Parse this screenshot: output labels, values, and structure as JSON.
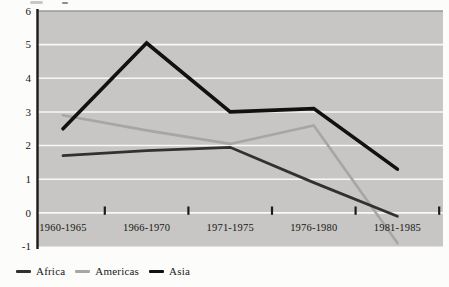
{
  "chart_data": {
    "type": "line",
    "title": "",
    "categories": [
      "1960-1965",
      "1966-1970",
      "1971-1975",
      "1976-1980",
      "1981-1985"
    ],
    "series": [
      {
        "name": "Africa",
        "color": "#333130",
        "stroke_width": 2.8,
        "values": [
          1.7,
          1.85,
          1.95,
          0.9,
          -0.1
        ]
      },
      {
        "name": "Americas",
        "color": "#a8a6a2",
        "stroke_width": 2.6,
        "values": [
          2.9,
          2.45,
          2.05,
          2.6,
          -0.9
        ]
      },
      {
        "name": "Asia",
        "color": "#121110",
        "stroke_width": 3.6,
        "values": [
          2.5,
          5.05,
          3.0,
          3.1,
          1.3
        ]
      }
    ],
    "y_ticks": [
      6,
      5,
      4,
      3,
      2,
      1,
      0,
      -1
    ],
    "ylim": [
      -1,
      6
    ],
    "xlabel": "",
    "ylabel": "",
    "grid": "horizontal-gridlines-on",
    "legend_position": "bottom-left",
    "colors": {
      "plot_background": "#c7c6c4",
      "gridline": "#f7f7f5",
      "plot_top_border": "#9b9a97",
      "y_axis_line": "#1c1b19",
      "tick_mark": "#1c1b19",
      "axis_label_text": "#171615"
    }
  }
}
